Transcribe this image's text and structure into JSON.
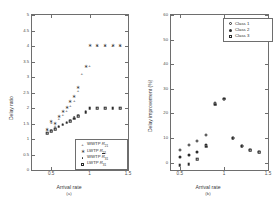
{
  "figure": {
    "background": "#ffffff",
    "marker_color": "#2b2b2b",
    "axis_color": "#6e6e6e"
  },
  "chart_data": [
    {
      "type": "scatter",
      "panel": "(a)",
      "title": "",
      "xlabel": "Arrival rate",
      "ylabel": "Delay ratio",
      "xlim": [
        0.25,
        1.5
      ],
      "ylim": [
        0,
        5
      ],
      "xticks": [
        0.5,
        1,
        1.5
      ],
      "xticklabels": [
        "0.5",
        "1",
        "1.5"
      ],
      "yticks": [
        0,
        0.5,
        1,
        1.5,
        2,
        2.5,
        3,
        3.5,
        4,
        4.5,
        5
      ],
      "yticklabels": [
        "0",
        "0.5",
        "1",
        "1.5",
        "2",
        "2.5",
        "3",
        "3.5",
        "4",
        "4.5",
        "5"
      ],
      "grid": false,
      "legend_position": "lower right",
      "series": [
        {
          "name": "WWTP R21",
          "label_main": "WWTP ",
          "label_sym": "R",
          "label_sub": "21",
          "overline": false,
          "marker": "plus",
          "x": [
            0.45,
            0.5,
            0.55,
            0.6,
            0.65,
            0.7,
            0.75,
            0.8,
            0.85,
            0.9,
            1.0,
            1.1,
            1.2,
            1.3,
            1.4
          ],
          "y": [
            1.28,
            1.52,
            1.42,
            1.65,
            1.76,
            1.9,
            2.08,
            2.22,
            2.56,
            3.1,
            3.35,
            4.0,
            4.0,
            4.0,
            4.0
          ]
        },
        {
          "name": "LWTP R21",
          "label_main": "LWTP ",
          "label_sym": "R",
          "label_sub": "21",
          "overline": false,
          "marker": "star",
          "x": [
            0.45,
            0.5,
            0.55,
            0.6,
            0.65,
            0.7,
            0.75,
            0.8,
            0.85,
            0.95,
            1.0,
            1.1,
            1.2,
            1.3,
            1.4
          ],
          "y": [
            1.3,
            1.55,
            1.48,
            1.72,
            1.88,
            2.0,
            2.2,
            2.36,
            2.66,
            3.33,
            4.0,
            4.0,
            4.0,
            4.0,
            4.0
          ]
        },
        {
          "name": "WWTP R31 (overline)",
          "label_main": "WWTP ",
          "label_sym": "R",
          "label_sub": "31",
          "overline": true,
          "marker": "dot",
          "x": [
            0.45,
            0.5,
            0.55,
            0.6,
            0.65,
            0.7,
            0.75,
            0.8,
            0.85,
            0.95,
            1.0,
            1.1,
            1.2,
            1.3,
            1.4
          ],
          "y": [
            1.2,
            1.3,
            1.36,
            1.42,
            1.5,
            1.56,
            1.62,
            1.7,
            1.78,
            1.9,
            2.0,
            2.0,
            2.0,
            2.0,
            2.0
          ]
        },
        {
          "name": "LWTP R31",
          "label_main": "LWTP ",
          "label_sym": "R",
          "label_sub": "31",
          "overline": false,
          "marker": "square",
          "x": [
            0.45,
            0.5,
            0.55,
            0.6,
            0.65,
            0.7,
            0.75,
            0.8,
            0.85,
            0.95,
            1.0,
            1.1,
            1.2,
            1.3,
            1.4
          ],
          "y": [
            1.18,
            1.26,
            1.32,
            1.4,
            1.46,
            1.52,
            1.58,
            1.66,
            1.74,
            1.86,
            2.0,
            2.0,
            2.0,
            2.0,
            2.0
          ]
        }
      ]
    },
    {
      "type": "scatter",
      "panel": "(b)",
      "title": "",
      "xlabel": "Arrival rate",
      "ylabel": "Delay improvement (%)",
      "xlim": [
        0.4,
        1.5
      ],
      "ylim": [
        -3,
        60
      ],
      "xticks": [
        0.5,
        1,
        1.5
      ],
      "xticklabels": [
        "0.5",
        "1",
        "1.5"
      ],
      "yticks": [
        0,
        10,
        20,
        30,
        40,
        50,
        60
      ],
      "yticklabels": [
        "0",
        "10",
        "20",
        "30",
        "40",
        "50",
        "60"
      ],
      "grid": false,
      "legend_position": "upper right",
      "series": [
        {
          "name": "Class 1",
          "label": "Class 1",
          "marker": "circle",
          "x": [
            0.5,
            0.6,
            0.7,
            0.8,
            0.9,
            1.0,
            1.1,
            1.2,
            1.3,
            1.4
          ],
          "y": [
            5.2,
            7.0,
            8.6,
            11.2,
            24.4,
            26.0,
            10.0,
            6.6,
            5.0,
            4.2
          ]
        },
        {
          "name": "Class 2",
          "label": "Class 2",
          "marker": "circle-filled",
          "x": [
            0.5,
            0.6,
            0.7,
            0.8,
            0.9,
            1.0,
            1.1,
            1.2,
            1.3,
            1.4
          ],
          "y": [
            2.2,
            3.2,
            4.4,
            7.2,
            24.0,
            26.0,
            10.0,
            6.6,
            5.0,
            4.2
          ]
        },
        {
          "name": "Class 3",
          "label": "Class 3",
          "marker": "square",
          "x": [
            0.5,
            0.6,
            0.7,
            0.8,
            0.9,
            1.0,
            1.1,
            1.2,
            1.3,
            1.4
          ],
          "y": [
            -1.0,
            -0.6,
            1.4,
            6.4,
            23.6,
            26.0,
            10.0,
            6.6,
            5.0,
            4.2
          ]
        }
      ]
    }
  ]
}
